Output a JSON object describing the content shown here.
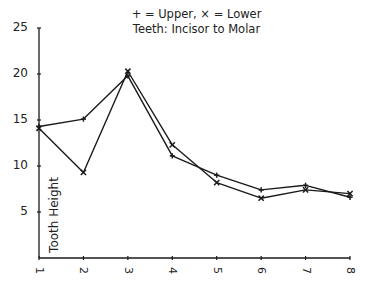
{
  "chart_data": {
    "type": "line",
    "title": "+ = Upper, × = Lower",
    "subtitle": "Teeth: Incisor to Molar",
    "xlabel": "",
    "ylabel": "Tooth Height",
    "x": [
      1,
      2,
      3,
      4,
      5,
      6,
      7,
      8
    ],
    "x_tick_labels": [
      "1",
      "2",
      "3",
      "4",
      "5",
      "6",
      "7",
      "8"
    ],
    "y_ticks": [
      5,
      10,
      15,
      20,
      25
    ],
    "y_tick_labels": [
      "5",
      "10",
      "15",
      "20",
      "25"
    ],
    "ylim": [
      0,
      25
    ],
    "xlim": [
      1,
      8
    ],
    "grid": false,
    "legend": "in title",
    "series": [
      {
        "name": "Upper",
        "marker": "+",
        "values": [
          14.3,
          15.1,
          19.8,
          11.1,
          9.0,
          7.4,
          7.9,
          6.6
        ]
      },
      {
        "name": "Lower",
        "marker": "×",
        "values": [
          14.1,
          9.3,
          20.3,
          12.3,
          8.2,
          6.5,
          7.4,
          7.0
        ]
      }
    ],
    "colors": {
      "line": "#1a1a1a",
      "axis": "#1a1a1a"
    }
  }
}
